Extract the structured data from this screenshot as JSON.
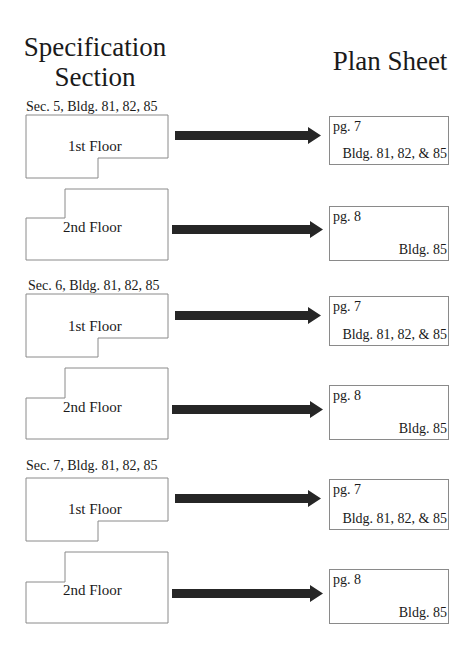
{
  "headings": {
    "left": [
      "Specification",
      "Section"
    ],
    "right": "Plan Sheet"
  },
  "colors": {
    "outline": "#8a8a8a",
    "arrow": "#262626",
    "text": "#1a1a1a"
  },
  "sections": [
    {
      "label": "Sec. 5, Bldg. 81, 82, 85",
      "rows": [
        {
          "floor": "1st Floor",
          "plan_page": "pg. 7",
          "plan_buildings": "Bldg. 81, 82, & 85"
        },
        {
          "floor": "2nd Floor",
          "plan_page": "pg. 8",
          "plan_buildings": "Bldg. 85"
        }
      ]
    },
    {
      "label": "Sec. 6, Bldg. 81, 82, 85",
      "rows": [
        {
          "floor": "1st Floor",
          "plan_page": "pg. 7",
          "plan_buildings": "Bldg. 81, 82, & 85"
        },
        {
          "floor": "2nd Floor",
          "plan_page": "pg. 8",
          "plan_buildings": "Bldg. 85"
        }
      ]
    },
    {
      "label": "Sec. 7, Bldg. 81, 82, 85",
      "rows": [
        {
          "floor": "1st Floor",
          "plan_page": "pg. 7",
          "plan_buildings": "Bldg. 81, 82, & 85"
        },
        {
          "floor": "2nd Floor",
          "plan_page": "pg. 8",
          "plan_buildings": "Bldg. 85"
        }
      ]
    }
  ]
}
